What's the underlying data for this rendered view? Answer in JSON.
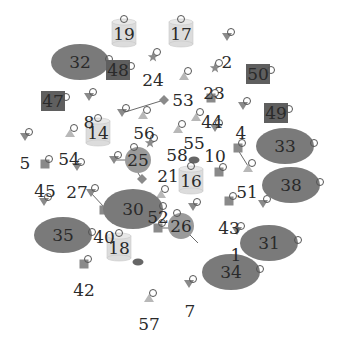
{
  "diagram": {
    "colors": {
      "ellipse_dark": "#7a7a7a",
      "square_dark": "#5f5f5f",
      "cylinder_light": "#dcdcdc",
      "circle_mid": "#9a9a9a",
      "marker_gray": "#8a8a8a",
      "marker_light": "#b8b8b8",
      "text": "#2a2a2a",
      "ring": "#555555"
    },
    "ellipse_nodes": [
      {
        "id": "32",
        "label": "32",
        "cx": 80,
        "cy": 62,
        "rx": 29,
        "ry": 18
      },
      {
        "id": "33",
        "label": "33",
        "cx": 285,
        "cy": 146,
        "rx": 29,
        "ry": 18
      },
      {
        "id": "38",
        "label": "38",
        "cx": 291,
        "cy": 185,
        "rx": 29,
        "ry": 18
      },
      {
        "id": "30",
        "label": "30",
        "cx": 133,
        "cy": 209,
        "rx": 30,
        "ry": 20
      },
      {
        "id": "35",
        "label": "35",
        "cx": 63,
        "cy": 235,
        "rx": 29,
        "ry": 18
      },
      {
        "id": "31",
        "label": "31",
        "cx": 269,
        "cy": 243,
        "rx": 29,
        "ry": 18
      },
      {
        "id": "34",
        "label": "34",
        "cx": 231,
        "cy": 272,
        "rx": 29,
        "ry": 18
      }
    ],
    "square_nodes": [
      {
        "id": "48",
        "label": "48",
        "x": 106,
        "y": 60,
        "w": 24,
        "h": 20
      },
      {
        "id": "50",
        "label": "50",
        "x": 246,
        "y": 64,
        "w": 24,
        "h": 20
      },
      {
        "id": "47",
        "label": "47",
        "x": 41,
        "y": 91,
        "w": 24,
        "h": 20
      },
      {
        "id": "49",
        "label": "49",
        "x": 264,
        "y": 103,
        "w": 24,
        "h": 20
      }
    ],
    "cylinder_nodes": [
      {
        "id": "19",
        "label": "19",
        "cx": 124,
        "cy": 33
      },
      {
        "id": "17",
        "label": "17",
        "cx": 181,
        "cy": 33
      },
      {
        "id": "14",
        "label": "14",
        "cx": 98,
        "cy": 132
      },
      {
        "id": "16",
        "label": "16",
        "cx": 191,
        "cy": 180
      },
      {
        "id": "18",
        "label": "18",
        "cx": 119,
        "cy": 247
      }
    ],
    "circle_nodes": [
      {
        "id": "25",
        "label": "25",
        "cx": 138,
        "cy": 160,
        "r": 13
      },
      {
        "id": "26",
        "label": "26",
        "cx": 181,
        "cy": 226,
        "r": 13
      }
    ],
    "text_labels": [
      {
        "id": "2",
        "label": "2",
        "x": 227,
        "y": 62
      },
      {
        "id": "24",
        "label": "24",
        "x": 153,
        "y": 80
      },
      {
        "id": "53",
        "label": "53",
        "x": 183,
        "y": 100
      },
      {
        "id": "23",
        "label": "23",
        "x": 214,
        "y": 93
      },
      {
        "id": "8",
        "label": "8",
        "x": 89,
        "y": 122
      },
      {
        "id": "56",
        "label": "56",
        "x": 144,
        "y": 133
      },
      {
        "id": "44",
        "label": "44",
        "x": 212,
        "y": 122
      },
      {
        "id": "4",
        "label": "4",
        "x": 241,
        "y": 133
      },
      {
        "id": "55",
        "label": "55",
        "x": 194,
        "y": 143
      },
      {
        "id": "58",
        "label": "58",
        "x": 177,
        "y": 155
      },
      {
        "id": "10",
        "label": "10",
        "x": 215,
        "y": 156
      },
      {
        "id": "5",
        "label": "5",
        "x": 25,
        "y": 163
      },
      {
        "id": "54",
        "label": "54",
        "x": 69,
        "y": 159
      },
      {
        "id": "21",
        "label": "21",
        "x": 168,
        "y": 176
      },
      {
        "id": "45",
        "label": "45",
        "x": 45,
        "y": 191
      },
      {
        "id": "27",
        "label": "27",
        "x": 77,
        "y": 192
      },
      {
        "id": "51",
        "label": "51",
        "x": 247,
        "y": 192
      },
      {
        "id": "52",
        "label": "52",
        "x": 158,
        "y": 217
      },
      {
        "id": "43",
        "label": "43",
        "x": 229,
        "y": 228
      },
      {
        "id": "40",
        "label": "40",
        "x": 104,
        "y": 237
      },
      {
        "id": "1",
        "label": "1",
        "x": 236,
        "y": 255
      },
      {
        "id": "42",
        "label": "42",
        "x": 84,
        "y": 290
      },
      {
        "id": "7",
        "label": "7",
        "x": 190,
        "y": 311
      },
      {
        "id": "57",
        "label": "57",
        "x": 149,
        "y": 324
      }
    ],
    "markers": [
      {
        "shape": "star",
        "x": 153,
        "y": 57
      },
      {
        "shape": "star",
        "x": 215,
        "y": 68
      },
      {
        "shape": "triangle-down",
        "x": 227,
        "y": 37
      },
      {
        "shape": "triangle-up",
        "x": 184,
        "y": 76
      },
      {
        "shape": "triangle-down",
        "x": 89,
        "y": 97
      },
      {
        "shape": "triangle-down",
        "x": 122,
        "y": 113
      },
      {
        "shape": "triangle-up",
        "x": 143,
        "y": 115
      },
      {
        "shape": "diamond",
        "x": 164,
        "y": 100
      },
      {
        "shape": "square",
        "x": 211,
        "y": 98
      },
      {
        "shape": "triangle-down",
        "x": 243,
        "y": 106
      },
      {
        "shape": "triangle-up",
        "x": 196,
        "y": 117
      },
      {
        "shape": "triangle-up",
        "x": 178,
        "y": 129
      },
      {
        "shape": "triangle-down",
        "x": 215,
        "y": 128
      },
      {
        "shape": "triangle-down",
        "x": 25,
        "y": 137
      },
      {
        "shape": "triangle-up",
        "x": 70,
        "y": 133
      },
      {
        "shape": "star",
        "x": 150,
        "y": 143
      },
      {
        "shape": "square",
        "x": 238,
        "y": 148
      },
      {
        "shape": "triangle-up",
        "x": 248,
        "y": 168
      },
      {
        "shape": "square",
        "x": 45,
        "y": 164
      },
      {
        "shape": "triangle-down",
        "x": 77,
        "y": 167
      },
      {
        "shape": "triangle-down",
        "x": 114,
        "y": 160
      },
      {
        "shape": "diamond",
        "x": 142,
        "y": 179
      },
      {
        "shape": "triangle-up",
        "x": 161,
        "y": 194
      },
      {
        "shape": "square",
        "x": 219,
        "y": 172
      },
      {
        "shape": "square",
        "x": 229,
        "y": 201
      },
      {
        "shape": "triangle-down",
        "x": 263,
        "y": 204
      },
      {
        "shape": "triangle-down",
        "x": 44,
        "y": 202
      },
      {
        "shape": "triangle-down",
        "x": 91,
        "y": 193
      },
      {
        "shape": "square",
        "x": 104,
        "y": 210
      },
      {
        "shape": "triangle-down",
        "x": 193,
        "y": 207
      },
      {
        "shape": "square",
        "x": 158,
        "y": 228
      },
      {
        "shape": "triangle-down",
        "x": 237,
        "y": 231
      },
      {
        "shape": "square",
        "x": 84,
        "y": 264
      },
      {
        "shape": "triangle-up",
        "x": 149,
        "y": 298
      },
      {
        "shape": "triangle-down",
        "x": 189,
        "y": 284
      },
      {
        "shape": "ellipse-small",
        "x": 138,
        "y": 262
      },
      {
        "shape": "ellipse-small",
        "x": 194,
        "y": 160
      }
    ],
    "edges": [
      {
        "from": [
          122,
          113
        ],
        "to": [
          164,
          100
        ]
      },
      {
        "from": [
          114,
          160
        ],
        "to": [
          128,
          160
        ]
      },
      {
        "from": [
          138,
          173
        ],
        "to": [
          142,
          179
        ]
      },
      {
        "from": [
          91,
          193
        ],
        "to": [
          104,
          207
        ]
      },
      {
        "from": [
          238,
          150
        ],
        "to": [
          248,
          166
        ]
      },
      {
        "from": [
          181,
          226
        ],
        "to": [
          198,
          243
        ]
      },
      {
        "from": [
          158,
          228
        ],
        "to": [
          170,
          228
        ]
      }
    ]
  }
}
